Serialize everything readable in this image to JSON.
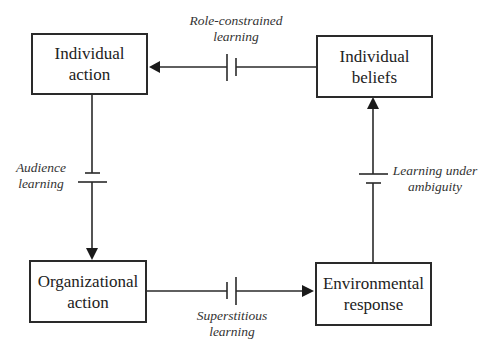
{
  "boxes": {
    "individual_action": {
      "line1": "Individual",
      "line2": "action"
    },
    "individual_beliefs": {
      "line1": "Individual",
      "line2": "beliefs"
    },
    "organizational_action": {
      "line1": "Organizational",
      "line2": "action"
    },
    "environmental_response": {
      "line1": "Environmental",
      "line2": "response"
    }
  },
  "labels": {
    "role_constrained": {
      "line1": "Role-constrained",
      "line2": "learning"
    },
    "audience": {
      "line1": "Audience",
      "line2": "learning"
    },
    "superstitious": {
      "line1": "Superstitious",
      "line2": "learning"
    },
    "ambiguity": {
      "line1": "Learning under",
      "line2": "ambiguity"
    }
  },
  "edges": [
    {
      "from": "Individual beliefs",
      "to": "Individual action",
      "label": "Role-constrained learning"
    },
    {
      "from": "Individual action",
      "to": "Organizational action",
      "label": "Audience learning"
    },
    {
      "from": "Organizational action",
      "to": "Environmental response",
      "label": "Superstitious learning"
    },
    {
      "from": "Environmental response",
      "to": "Individual beliefs",
      "label": "Learning under ambiguity"
    }
  ],
  "colors": {
    "line": "#2a2a2a",
    "text": "#222222",
    "background": "#ffffff"
  }
}
